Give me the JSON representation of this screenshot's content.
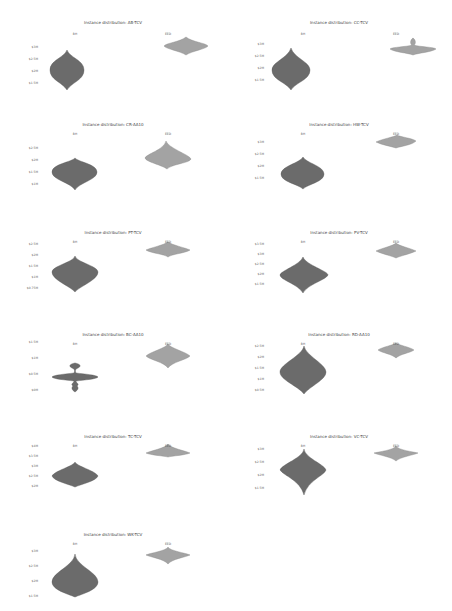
{
  "chart_data": [
    {
      "type": "violin",
      "title": "Instance distribution: AB-TCV",
      "categories": [
        "BH",
        "EED"
      ],
      "yticks": [
        "$3M",
        "$2.5M",
        "$2M",
        "$1.5M"
      ],
      "col": 0,
      "row": 0,
      "y0": 0
    },
    {
      "type": "violin",
      "title": "Instance distribution: CC-TCV",
      "categories": [
        "BH",
        "EED"
      ],
      "yticks": [
        "$3M",
        "$2.5M",
        "$2M",
        "$1.5M"
      ],
      "col": 1,
      "row": 0,
      "y0": 0
    },
    {
      "type": "violin",
      "title": "Instance distribution: CR-AA10",
      "categories": [
        "BH",
        "EED"
      ],
      "yticks": [
        "$2.5M",
        "$2M",
        "$1.5M",
        "$1M"
      ],
      "col": 0,
      "row": 1,
      "y0": 110
    },
    {
      "type": "violin",
      "title": "Instance distribution: HW-TCV",
      "categories": [
        "BH",
        "EED"
      ],
      "yticks": [
        "$3M",
        "$2.5M",
        "$2M",
        "$1.5M"
      ],
      "col": 1,
      "row": 1,
      "y0": 110
    },
    {
      "type": "violin",
      "title": "Instance distribution: PT-TCV",
      "categories": [
        "BH",
        "EED"
      ],
      "yticks": [
        "$2.5M",
        "$2M",
        "$1.5M",
        "$1M",
        "$0.75M"
      ],
      "col": 0,
      "row": 2,
      "y0": 218
    },
    {
      "type": "violin",
      "title": "Instance distribution: PV-TCV",
      "categories": [
        "BH",
        "EED"
      ],
      "yticks": [
        "$3.5M",
        "$3M",
        "$2.5M",
        "$2M",
        "$1.5M"
      ],
      "col": 1,
      "row": 2,
      "y0": 218
    },
    {
      "type": "violin",
      "title": "Instance distribution: BC-AA10",
      "categories": [
        "BH",
        "EED"
      ],
      "yticks": [
        "$1.5M",
        "$1M",
        "$0.5M",
        "$0M"
      ],
      "col": 0,
      "row": 3,
      "y0": 320
    },
    {
      "type": "violin",
      "title": "Instance distribution: RD-AA10",
      "categories": [
        "BH",
        "EED"
      ],
      "yticks": [
        "$2.5M",
        "$2M",
        "$1.5M",
        "$1M",
        "$0.5M"
      ],
      "col": 1,
      "row": 3,
      "y0": 320
    },
    {
      "type": "violin",
      "title": "Instance distribution: TC-TCV",
      "categories": [
        "BH",
        "EED"
      ],
      "yticks": [
        "$4M",
        "$3.5M",
        "$3M",
        "$2.5M",
        "$2M"
      ],
      "col": 0,
      "row": 4,
      "y0": 422
    },
    {
      "type": "violin",
      "title": "Instance distribution: VC-TCV",
      "categories": [
        "BH",
        "EED"
      ],
      "yticks": [
        "$3M",
        "$2.5M",
        "$2M",
        "$1.5M"
      ],
      "col": 1,
      "row": 4,
      "y0": 422
    },
    {
      "type": "violin",
      "title": "Instance distribution: WK-TCV",
      "categories": [
        "BH",
        "EED"
      ],
      "yticks": [
        "$3M",
        "$2.5M",
        "$2M",
        "$1.5M"
      ],
      "col": 0,
      "row": 5,
      "y0": 520
    }
  ],
  "colors": {
    "left": "#6b6b6b",
    "right": "#a3a3a3"
  }
}
